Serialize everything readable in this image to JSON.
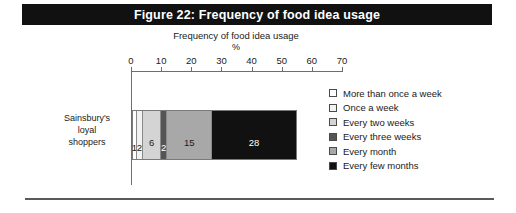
{
  "figure": {
    "title": "Figure 22: Frequency of food idea usage",
    "title_band_color": "#111111",
    "title_text_color": "#ffffff"
  },
  "axis": {
    "title": "Frequency of food idea usage",
    "unit": "%",
    "tick_labels": [
      "0",
      "10",
      "20",
      "30",
      "40",
      "50",
      "60",
      "70"
    ],
    "axis_color": "#6e6e6e"
  },
  "category": {
    "line1": "Sainsbury's",
    "line2": "loyal",
    "line3": "shoppers"
  },
  "legend": {
    "items": [
      {
        "label": "More than once a week",
        "color": "#ffffff"
      },
      {
        "label": "Once a week",
        "color": "#f2f2f2"
      },
      {
        "label": "Every two weeks",
        "color": "#d4d4d4"
      },
      {
        "label": "Every three weeks",
        "color": "#555555"
      },
      {
        "label": "Every month",
        "color": "#a8a8a8"
      },
      {
        "label": "Every few months",
        "color": "#111111"
      }
    ]
  },
  "chart_data": {
    "type": "bar",
    "orientation": "horizontal",
    "stacked": true,
    "title": "Figure 22: Frequency of food idea usage",
    "subtitle": "Frequency of food idea usage",
    "xlabel": "%",
    "ylabel": "",
    "xlim": [
      0,
      70
    ],
    "xticks": [
      0,
      10,
      20,
      30,
      40,
      50,
      60,
      70
    ],
    "grid": false,
    "legend_position": "right",
    "categories": [
      "Sainsbury's loyal shoppers"
    ],
    "series": [
      {
        "name": "More than once a week",
        "values": [
          1
        ],
        "color": "#ffffff",
        "label": "1",
        "label_color": "#1a1a1a"
      },
      {
        "name": "Once a week",
        "values": [
          2
        ],
        "color": "#f2f2f2",
        "label": "2",
        "label_color": "#1a1a1a"
      },
      {
        "name": "Every two weeks",
        "values": [
          6
        ],
        "color": "#d4d4d4",
        "label": "6",
        "label_color": "#1a1a1a"
      },
      {
        "name": "Every three weeks",
        "values": [
          2
        ],
        "color": "#555555",
        "label": "2",
        "label_color": "#ffffff"
      },
      {
        "name": "Every month",
        "values": [
          15
        ],
        "color": "#a8a8a8",
        "label": "15",
        "label_color": "#1a1a1a"
      },
      {
        "name": "Every few months",
        "values": [
          28
        ],
        "color": "#111111",
        "label": "28",
        "label_color": "#ffffff"
      }
    ],
    "total": 54
  }
}
